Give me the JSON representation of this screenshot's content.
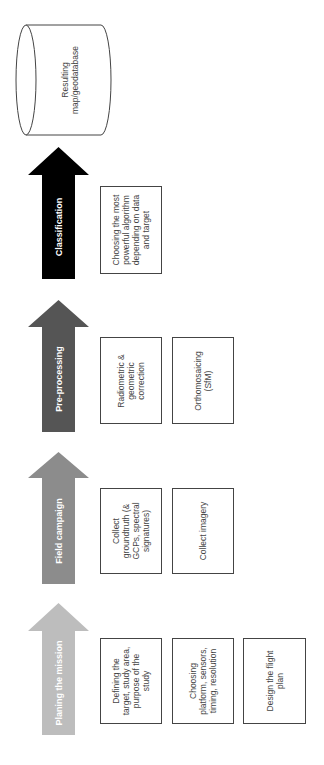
{
  "diagram": {
    "orientation": "rotated-90-ccw",
    "stages": [
      {
        "label": "Planing the mission",
        "color": "#bdbdbd",
        "tasks": [
          "Defining the\ntarget, study area,\npurpose of the\nstudy",
          "Choosing\nplatform, sensors,\ntiming, resolution",
          "Design the flight\nplan"
        ]
      },
      {
        "label": "Field campaign",
        "color": "#8c8c8c",
        "tasks": [
          "Collect\ngroundtruth (&\nGCPs, spectral\nsignatures)",
          "Collect imagery"
        ]
      },
      {
        "label": "Pre-processing",
        "color": "#555555",
        "tasks": [
          "Radiometric &\ngeometric\ncorrection",
          "Orthomosaicing\n(SfM)"
        ]
      },
      {
        "label": "Classification",
        "color": "#000000",
        "tasks": [
          "Choosing the most\npowerful algorithm\ndepending on data\nand target"
        ]
      }
    ],
    "output": {
      "label": "Resulting\nmap/geodatabase",
      "shape": "cylinder"
    }
  }
}
